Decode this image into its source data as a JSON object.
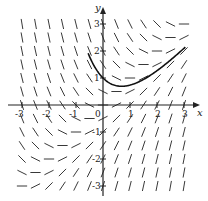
{
  "figure": {
    "equation_hint": "dy/dx = x - y",
    "axes": {
      "x_label": "x",
      "y_label": "y",
      "x_ticks": [
        "-3",
        "-2",
        "-1",
        "0",
        "1",
        "2",
        "3"
      ],
      "y_ticks": [
        "3",
        "2",
        "1",
        "-1",
        "-2",
        "-3"
      ],
      "xlim": [
        -3.4,
        3.5
      ],
      "ylim": [
        -3.4,
        3.5
      ]
    },
    "colors": {
      "ink": "#222222",
      "background": "#ffffff"
    },
    "slope_field": {
      "x_range": [
        -3,
        3
      ],
      "y_range": [
        -3,
        3
      ],
      "step": 0.5,
      "segment_length": 0.38
    },
    "solution_curve": {
      "formula": "y = x - 1 + 2e^(-x)",
      "x_range": [
        -0.55,
        3.05
      ]
    }
  }
}
